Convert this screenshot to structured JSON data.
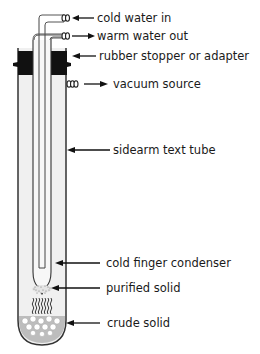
{
  "diagram": {
    "labels": {
      "cold_water_in": "cold water in",
      "warm_water_out": "warm water out",
      "stopper": "rubber stopper or adapter",
      "vacuum": "vacuum source",
      "sidearm_tube": "sidearm text tube",
      "cold_finger": "cold finger condenser",
      "purified_solid": "purified solid",
      "crude_solid": "crude solid"
    },
    "colors": {
      "stroke": "#333333",
      "stopper": "#111111",
      "tube_fill": "#f0f0f0",
      "solid": "#bdbdbd",
      "background": "#ffffff"
    }
  }
}
